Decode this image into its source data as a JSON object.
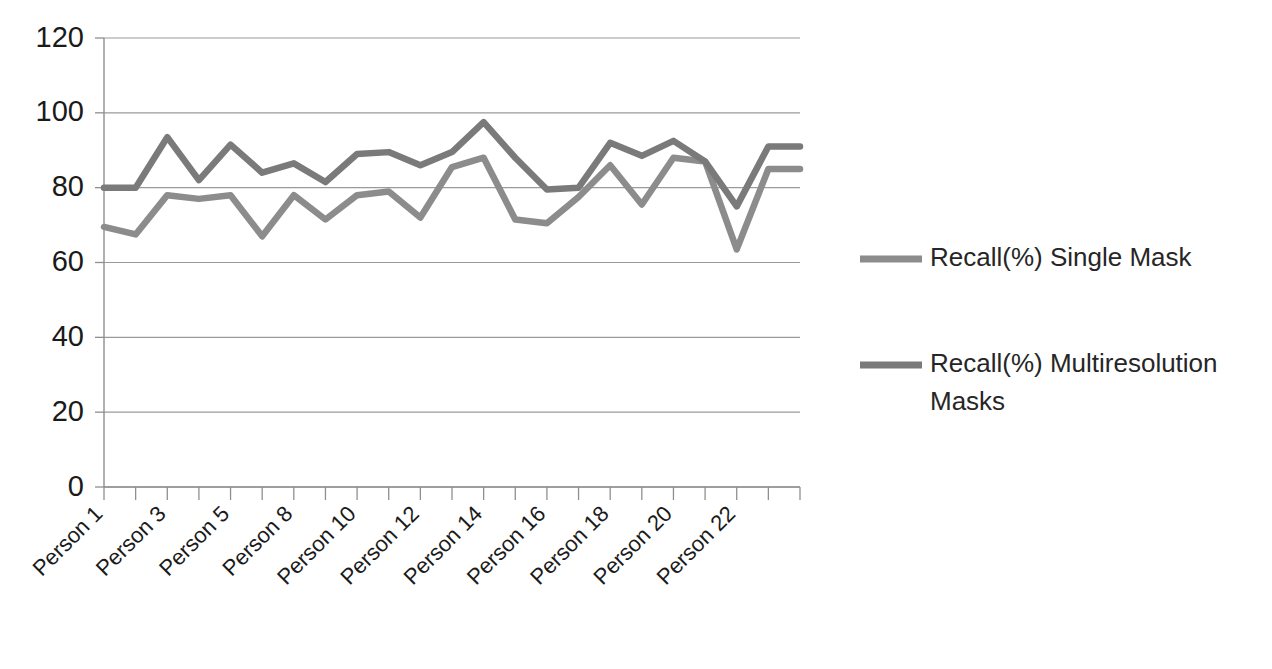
{
  "chart_data": {
    "type": "line",
    "title": "",
    "xlabel": "",
    "ylabel": "",
    "ylim": [
      0,
      120
    ],
    "ytick_values": [
      0,
      20,
      40,
      60,
      80,
      100,
      120
    ],
    "ytick_labels": [
      "0",
      "20",
      "40",
      "60",
      "80",
      "100",
      "120"
    ],
    "grid": true,
    "legend_position": "right",
    "x": [
      "Person 1",
      "Person 2",
      "Person 3",
      "Person 4",
      "Person 5",
      "Person 6",
      "Person 7",
      "Person 8",
      "Person 9",
      "Person 10",
      "Person 11",
      "Person 12",
      "Person 13",
      "Person 14",
      "Person 15",
      "Person 16",
      "Person 17",
      "Person 18",
      "Person 19",
      "Person 20",
      "Person 21",
      "Person 22",
      "Person 23"
    ],
    "xtick_labels": [
      "Person 1",
      "Person 3",
      "Person 5",
      "Person 8",
      "Person 10",
      "Person 12",
      "Person 14",
      "Person 16",
      "Person 18",
      "Person 20",
      "Person 22"
    ],
    "xtick_indices": [
      0,
      2,
      4,
      6,
      8,
      10,
      12,
      14,
      16,
      18,
      20
    ],
    "series": [
      {
        "name": "Recall(%) Single Mask",
        "color": "#8c8c8c",
        "values": [
          69.5,
          67.5,
          78.0,
          77.0,
          78.0,
          67.0,
          78.0,
          71.5,
          78.0,
          79.0,
          72.0,
          85.5,
          88.0,
          71.5,
          70.5,
          77.5,
          86.0,
          75.5,
          88.0,
          87.0,
          63.5,
          85.0,
          85.0
        ]
      },
      {
        "name": "Recall(%) Multiresolution Masks",
        "color": "#7a7a7a",
        "values": [
          80.0,
          80.0,
          93.5,
          82.0,
          91.5,
          84.0,
          86.5,
          81.5,
          89.0,
          89.5,
          86.0,
          89.5,
          97.5,
          88.0,
          79.5,
          80.0,
          92.0,
          88.5,
          92.5,
          87.0,
          75.0,
          91.0,
          91.0
        ]
      }
    ]
  },
  "legend": {
    "items": [
      {
        "label": "Recall(%) Single Mask",
        "color": "#8c8c8c"
      },
      {
        "label": "Recall(%) Multiresolution",
        "label2": "Masks",
        "color": "#7a7a7a"
      }
    ]
  }
}
